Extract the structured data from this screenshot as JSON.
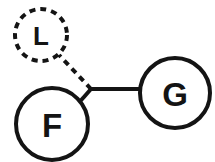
{
  "diagram": {
    "type": "node-link-graph",
    "background_color": "#ffffff",
    "stroke_color": "#141414",
    "label_color": "#141414",
    "nodes": [
      {
        "id": "L",
        "label": "L",
        "shape": "circle",
        "border_style": "dashed",
        "cx": 41,
        "cy": 35,
        "r": 26,
        "stroke_width": 4,
        "dash_pattern": "6 5",
        "font_size": 26
      },
      {
        "id": "F",
        "label": "F",
        "shape": "circle",
        "border_style": "solid",
        "cx": 52,
        "cy": 124,
        "r": 36,
        "stroke_width": 4,
        "dash_pattern": "",
        "font_size": 33
      },
      {
        "id": "G",
        "label": "G",
        "shape": "circle",
        "border_style": "solid",
        "cx": 175,
        "cy": 93,
        "r": 35,
        "stroke_width": 4,
        "dash_pattern": "",
        "font_size": 33
      }
    ],
    "junction": {
      "id": "junction",
      "x": 91,
      "y": 89
    },
    "edges": [
      {
        "id": "edge-junction-L",
        "from": "junction",
        "to": "L",
        "style": "dashed",
        "x1": 91,
        "y1": 89,
        "x2": 59,
        "y2": 55,
        "stroke_width": 4,
        "dash_pattern": "6 5"
      },
      {
        "id": "edge-junction-F",
        "from": "junction",
        "to": "F",
        "style": "solid",
        "x1": 91,
        "y1": 89,
        "x2": 76,
        "y2": 106,
        "stroke_width": 4,
        "dash_pattern": ""
      },
      {
        "id": "edge-junction-G",
        "from": "junction",
        "to": "G",
        "style": "solid",
        "x1": 91,
        "y1": 89,
        "x2": 140,
        "y2": 89,
        "stroke_width": 4,
        "dash_pattern": ""
      }
    ]
  }
}
